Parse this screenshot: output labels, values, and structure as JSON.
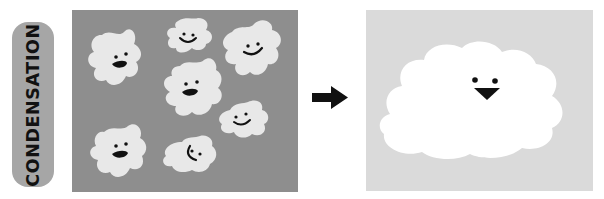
{
  "label": {
    "text": "CONDENSATION"
  },
  "colors": {
    "label_pill": "#a6a6a6",
    "before_background": "#8e8e8e",
    "droplet_fill": "#e8e8e8",
    "after_background": "#dadada",
    "cloud_fill": "#ffffff",
    "face": "#111111",
    "arrow": "#111111"
  },
  "before_panel": {
    "description": "Many small smiling water-vapor puffs",
    "droplet_count": 8
  },
  "arrow": {
    "direction": "right"
  },
  "after_panel": {
    "description": "One large cloud with face (two eyes and a triangular beak)"
  }
}
